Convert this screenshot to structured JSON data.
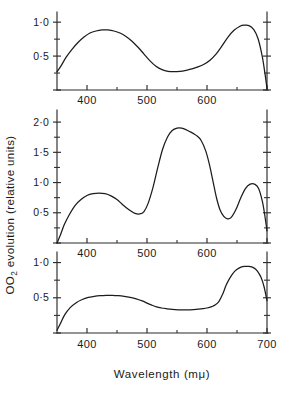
{
  "figure": {
    "xlabel": "Wavelength  (mμ)",
    "ylabel_main": "O",
    "ylabel_sub": "2",
    "ylabel_rest": " evolution (relative units)"
  },
  "chart_data": [
    {
      "type": "line",
      "panel": "top",
      "title": "",
      "xlabel": "Wavelength (mμ)",
      "ylabel": "O2 evolution (relative units)",
      "xlim": [
        350,
        700
      ],
      "ylim": [
        0,
        1.15
      ],
      "grid": false,
      "legend": "none",
      "xticks": [
        400,
        500,
        600,
        700
      ],
      "xticks_minor": [
        450,
        550,
        650
      ],
      "xtick_labels": [
        "400",
        "500",
        "600",
        ""
      ],
      "yticks": [
        0,
        0.5,
        1.0
      ],
      "ytick_labels": [
        "",
        "0·5",
        "1·0"
      ],
      "yticks_minor": [
        0.25,
        0.75
      ],
      "x": [
        350,
        357,
        365,
        375,
        385,
        395,
        405,
        415,
        425,
        435,
        445,
        455,
        465,
        475,
        485,
        495,
        505,
        515,
        525,
        535,
        545,
        555,
        565,
        575,
        585,
        595,
        605,
        615,
        625,
        635,
        645,
        655,
        662,
        670,
        678,
        685,
        692,
        697,
        700
      ],
      "values": [
        0.27,
        0.36,
        0.48,
        0.6,
        0.7,
        0.78,
        0.84,
        0.87,
        0.885,
        0.885,
        0.87,
        0.84,
        0.79,
        0.72,
        0.63,
        0.53,
        0.43,
        0.35,
        0.3,
        0.275,
        0.27,
        0.275,
        0.29,
        0.31,
        0.34,
        0.38,
        0.44,
        0.53,
        0.65,
        0.78,
        0.88,
        0.94,
        0.955,
        0.95,
        0.89,
        0.76,
        0.5,
        0.22,
        0.02
      ]
    },
    {
      "type": "line",
      "panel": "middle",
      "title": "",
      "xlabel": "Wavelength (mμ)",
      "ylabel": "O2 evolution (relative units)",
      "xlim": [
        350,
        700
      ],
      "ylim": [
        0,
        2.2
      ],
      "grid": false,
      "legend": "none",
      "xticks": [
        400,
        500,
        600,
        700
      ],
      "xticks_minor": [
        450,
        550,
        650
      ],
      "xtick_labels": [
        "400",
        "500",
        "600",
        ""
      ],
      "yticks": [
        0,
        0.5,
        1.0,
        1.5,
        2.0
      ],
      "ytick_labels": [
        "",
        "0·5",
        "1·0",
        "1·5",
        "2·0"
      ],
      "yticks_minor": [
        0.25,
        0.75,
        1.25,
        1.75
      ],
      "x": [
        350,
        356,
        362,
        370,
        380,
        390,
        400,
        410,
        420,
        430,
        440,
        450,
        460,
        470,
        480,
        488,
        495,
        502,
        510,
        518,
        526,
        534,
        542,
        550,
        558,
        566,
        574,
        582,
        590,
        598,
        604,
        610,
        616,
        622,
        628,
        634,
        640,
        648,
        656,
        664,
        672,
        680,
        686,
        692,
        696,
        700
      ],
      "values": [
        0.0,
        0.14,
        0.3,
        0.46,
        0.62,
        0.72,
        0.785,
        0.815,
        0.825,
        0.815,
        0.78,
        0.72,
        0.63,
        0.55,
        0.49,
        0.48,
        0.52,
        0.66,
        0.92,
        1.25,
        1.55,
        1.75,
        1.86,
        1.9,
        1.9,
        1.87,
        1.83,
        1.78,
        1.7,
        1.52,
        1.3,
        1.02,
        0.74,
        0.54,
        0.44,
        0.4,
        0.42,
        0.55,
        0.74,
        0.9,
        0.975,
        0.97,
        0.9,
        0.7,
        0.48,
        0.2
      ]
    },
    {
      "type": "line",
      "panel": "bottom",
      "title": "",
      "xlabel": "Wavelength (mμ)",
      "ylabel": "O2 evolution (relative units)",
      "xlim": [
        350,
        700
      ],
      "ylim": [
        0,
        1.15
      ],
      "grid": false,
      "legend": "none",
      "xticks": [
        400,
        500,
        600,
        700
      ],
      "xticks_minor": [
        450,
        550,
        650
      ],
      "xtick_labels": [
        "400",
        "500",
        "600",
        "700"
      ],
      "yticks": [
        0,
        0.5,
        1.0
      ],
      "ytick_labels": [
        "",
        "0·5",
        "1·0"
      ],
      "yticks_minor": [
        0.25,
        0.75
      ],
      "x": [
        350,
        356,
        363,
        372,
        382,
        392,
        402,
        412,
        422,
        432,
        442,
        452,
        462,
        472,
        482,
        492,
        500,
        508,
        516,
        524,
        532,
        542,
        552,
        562,
        572,
        582,
        592,
        600,
        608,
        614,
        620,
        626,
        632,
        638,
        646,
        654,
        662,
        670,
        678,
        684,
        690,
        695,
        700
      ],
      "values": [
        0.04,
        0.14,
        0.26,
        0.36,
        0.43,
        0.475,
        0.505,
        0.52,
        0.53,
        0.535,
        0.535,
        0.53,
        0.52,
        0.505,
        0.485,
        0.455,
        0.425,
        0.395,
        0.37,
        0.355,
        0.345,
        0.335,
        0.33,
        0.33,
        0.33,
        0.335,
        0.345,
        0.355,
        0.375,
        0.4,
        0.45,
        0.55,
        0.68,
        0.78,
        0.875,
        0.925,
        0.945,
        0.945,
        0.925,
        0.88,
        0.79,
        0.66,
        0.46
      ]
    }
  ]
}
